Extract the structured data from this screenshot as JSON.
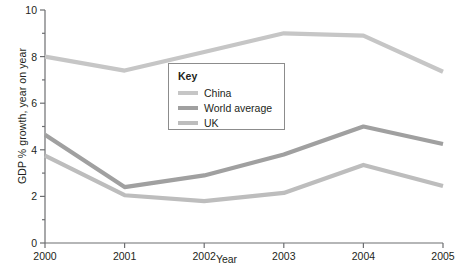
{
  "chart_data": {
    "type": "line",
    "title": "",
    "xlabel": "Year",
    "ylabel": "GDP % growth, year on year",
    "categories": [
      "2000",
      "2001",
      "2002",
      "2003",
      "2004",
      "2005"
    ],
    "x": [
      2000,
      2001,
      2002,
      2003,
      2004,
      2005
    ],
    "xlim": [
      2000,
      2005
    ],
    "ylim": [
      0,
      10
    ],
    "yticks": [
      0,
      2,
      4,
      6,
      8,
      10
    ],
    "ytick_labels": [
      "0",
      "2",
      "4",
      "6",
      "8",
      "10"
    ],
    "xticks": [
      2000,
      2001,
      2002,
      2003,
      2004,
      2005
    ],
    "xtick_labels": [
      "2000",
      "2001",
      "2002",
      "2003",
      "2004",
      "2005"
    ],
    "grid": false,
    "legend_position": "center",
    "legend_title": "Key",
    "series": [
      {
        "name": "China",
        "color": "#c6c6c6",
        "values": [
          8.0,
          7.4,
          8.2,
          9.0,
          8.9,
          7.35
        ]
      },
      {
        "name": "World average",
        "color": "#a0a0a0",
        "values": [
          4.65,
          2.4,
          2.9,
          3.8,
          5.0,
          4.25
        ]
      },
      {
        "name": "UK",
        "color": "#bdbdbd",
        "values": [
          3.75,
          2.05,
          1.8,
          2.15,
          3.35,
          2.45
        ]
      }
    ]
  },
  "axis": {
    "axis_color": "#6d6e71",
    "text_color": "#231f20"
  }
}
